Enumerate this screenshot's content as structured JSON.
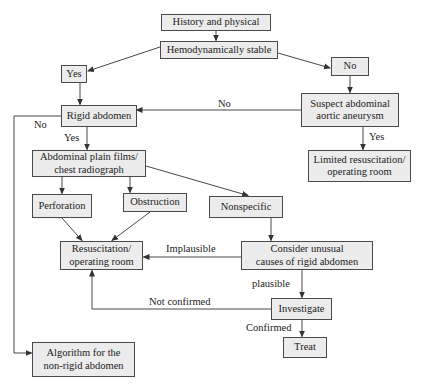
{
  "nodes": {
    "history": "History and physical",
    "hemodynamic": "Hemodynamically stable",
    "yes_stable": "Yes",
    "no_stable": "No",
    "rigid": "Rigid abdomen",
    "suspect_line1": "Suspect abdominal",
    "suspect_line2": "aortic aneurysm",
    "limited_line1": "Limited resuscitation/",
    "limited_line2": "operating room",
    "films_line1": "Abdominal plain films/",
    "films_line2": "chest radiograph",
    "perforation": "Perforation",
    "obstruction": "Obstruction",
    "nonspecific": "Nonspecific",
    "resus_line1": "Resuscitation/",
    "resus_line2": "operating room",
    "consider_line1": "Consider unusual",
    "consider_line2": "causes of rigid abdomen",
    "investigate": "Investigate",
    "treat": "Treat",
    "algorithm_line1": "Algorithm for the",
    "algorithm_line2": "non-rigid abdomen"
  },
  "edge_labels": {
    "suspect_to_rigid": "No",
    "rigid_to_algorithm": "No",
    "rigid_to_films": "Yes",
    "suspect_to_limited": "Yes",
    "consider_to_resus": "Implausible",
    "consider_to_investigate": "plausible",
    "investigate_to_resus": "Not confirmed",
    "investigate_to_treat": "Confirmed"
  },
  "colors": {
    "box_fill": "#ececec",
    "box_border": "#4a4a4a",
    "line": "#333333"
  }
}
